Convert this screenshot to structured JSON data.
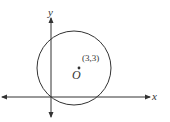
{
  "diagram": {
    "type": "coordinate-plane-circle",
    "axes": {
      "x_label": "x",
      "y_label": "y"
    },
    "circle": {
      "center_label": "O",
      "center_coordinates_label": "(3,3)"
    },
    "colors": {
      "stroke": "#333333",
      "background": "#ffffff"
    }
  }
}
